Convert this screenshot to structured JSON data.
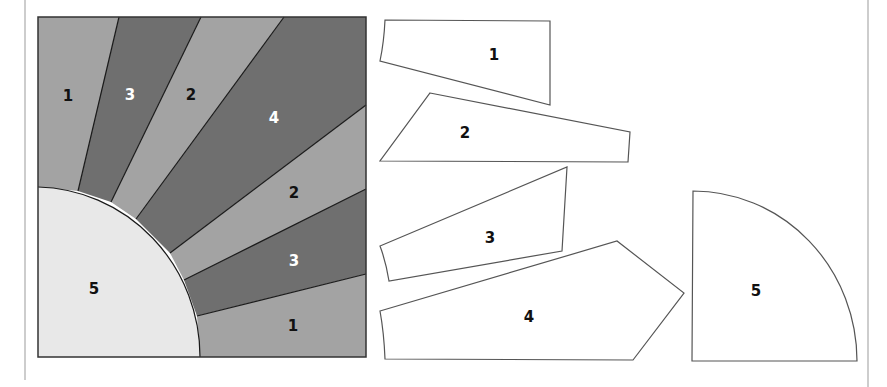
{
  "diagram": {
    "colors": {
      "light": "#a3a3a3",
      "dark": "#6f6f6f",
      "center": "#e8e8e8",
      "outline": "#555555",
      "page_rule": "#bdbdbd"
    },
    "block": {
      "rays": [
        {
          "label": "1",
          "shade": "light"
        },
        {
          "label": "3",
          "shade": "dark"
        },
        {
          "label": "2",
          "shade": "light"
        },
        {
          "label": "4",
          "shade": "dark"
        },
        {
          "label": "2",
          "shade": "light"
        },
        {
          "label": "3",
          "shade": "dark"
        },
        {
          "label": "1",
          "shade": "light"
        }
      ],
      "center": {
        "label": "5",
        "shade": "center"
      }
    },
    "pieces": [
      {
        "label": "1"
      },
      {
        "label": "2"
      },
      {
        "label": "3"
      },
      {
        "label": "4"
      },
      {
        "label": "5"
      }
    ]
  }
}
